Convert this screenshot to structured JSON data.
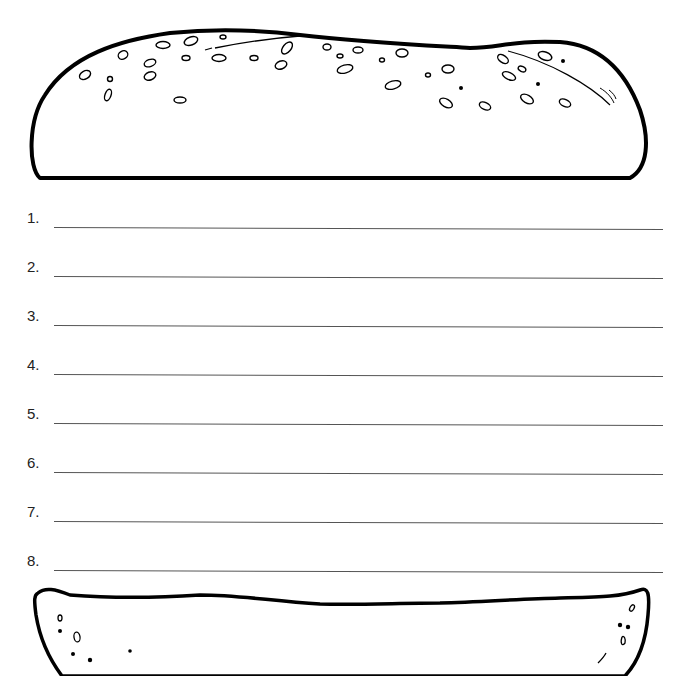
{
  "worksheet": {
    "top_bun": {
      "icon": "top-bun-with-sesame-seeds"
    },
    "bottom_bun": {
      "icon": "bottom-bun"
    },
    "lines": [
      {
        "number": "1.",
        "value": ""
      },
      {
        "number": "2.",
        "value": ""
      },
      {
        "number": "3.",
        "value": ""
      },
      {
        "number": "4.",
        "value": ""
      },
      {
        "number": "5.",
        "value": ""
      },
      {
        "number": "6.",
        "value": ""
      },
      {
        "number": "7.",
        "value": ""
      },
      {
        "number": "8.",
        "value": ""
      }
    ],
    "colors": {
      "ink": "#000000",
      "line": "#555555",
      "paper": "#ffffff"
    }
  }
}
